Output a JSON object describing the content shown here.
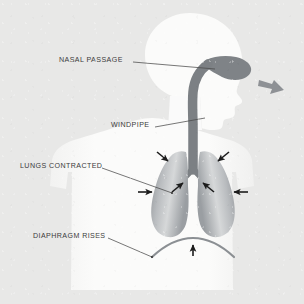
{
  "diagram": {
    "background_color": "#e8e8e7",
    "body_color": "#fafafa",
    "airway_color": "#7c8084",
    "arrow_color": "#1c1c1c",
    "exhale_arrow_color": "#8e9195",
    "leader_line_color": "#4a4a4a",
    "label_color": "#3b3b3b"
  },
  "labels": [
    {
      "id": "nasal-passage",
      "text": "NASAL PASSAGE",
      "x": 59,
      "y": 57,
      "leader_from": [
        133,
        62
      ],
      "leader_to": [
        215,
        69
      ]
    },
    {
      "id": "windpipe",
      "text": "WINDPIPE",
      "x": 111,
      "y": 122,
      "leader_from": [
        155,
        127
      ],
      "leader_to": [
        205,
        118
      ]
    },
    {
      "id": "lungs-contracted",
      "text": "LUNGS CONTRACTED",
      "x": 20,
      "y": 163,
      "leader_from": [
        102,
        168
      ],
      "leader_to": [
        172,
        193
      ]
    },
    {
      "id": "diaphragm-rises",
      "text": "DIAPHRAGM RISES",
      "x": 33,
      "y": 233,
      "leader_from": [
        108,
        238
      ],
      "leader_to": [
        152,
        257
      ]
    }
  ],
  "annotations": {
    "exhale_arrow": "exhale-arrow-out-of-nose",
    "lung_compression_arrows": [
      "arrow-upper-left-inward",
      "arrow-upper-right-inward",
      "arrow-mid-left-inward",
      "arrow-mid-right-inward",
      "arrow-outer-left-inward",
      "arrow-outer-right-inward"
    ],
    "diaphragm_arrow": "arrow-diaphragm-upward"
  },
  "anatomy": {
    "head": "head-profile-silhouette",
    "torso": "torso-silhouette",
    "nasal_passage": "nasal-passage-shape",
    "trachea": "trachea-windpipe",
    "bronchi": "bronchi-branches",
    "left_lung": "left-lung-contracted",
    "right_lung": "right-lung-contracted",
    "diaphragm": "diaphragm-arc-raised"
  }
}
